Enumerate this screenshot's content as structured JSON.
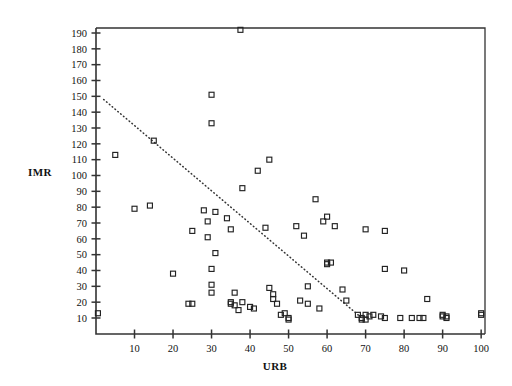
{
  "figure": {
    "background": "#ffffff",
    "axis_color": "#333333",
    "marker_color": "#222222",
    "trend_color": "#333333"
  },
  "chart_data": {
    "type": "scatter",
    "title": "",
    "xlabel": "URB",
    "ylabel": "IMR",
    "xlim": [
      0,
      101
    ],
    "ylim": [
      0,
      196
    ],
    "grid": false,
    "legend": "none",
    "xticks": [
      10,
      20,
      30,
      40,
      50,
      60,
      70,
      80,
      90,
      100
    ],
    "yticks": [
      10,
      20,
      30,
      40,
      50,
      60,
      70,
      80,
      90,
      100,
      110,
      120,
      130,
      140,
      150,
      160,
      170,
      180,
      190
    ],
    "marker": "open-square",
    "marker_size": 5,
    "points": [
      [
        0.5,
        13
      ],
      [
        5,
        113
      ],
      [
        10,
        79
      ],
      [
        14,
        81
      ],
      [
        15,
        122
      ],
      [
        20,
        38
      ],
      [
        24,
        19
      ],
      [
        25,
        19
      ],
      [
        25,
        65
      ],
      [
        28,
        78
      ],
      [
        29,
        71
      ],
      [
        29,
        61
      ],
      [
        30,
        151
      ],
      [
        30,
        133
      ],
      [
        30,
        31
      ],
      [
        30,
        26
      ],
      [
        30,
        41
      ],
      [
        31,
        77
      ],
      [
        31,
        51
      ],
      [
        34,
        73
      ],
      [
        35,
        20
      ],
      [
        35,
        19
      ],
      [
        35,
        66
      ],
      [
        36,
        18
      ],
      [
        36,
        26
      ],
      [
        37,
        15
      ],
      [
        37.5,
        192
      ],
      [
        38,
        20
      ],
      [
        38,
        92
      ],
      [
        40,
        17
      ],
      [
        41,
        16
      ],
      [
        42,
        103
      ],
      [
        44,
        67
      ],
      [
        45,
        29
      ],
      [
        45,
        110
      ],
      [
        46,
        25
      ],
      [
        46,
        22
      ],
      [
        47,
        19
      ],
      [
        48,
        12
      ],
      [
        49,
        13
      ],
      [
        50,
        9
      ],
      [
        50,
        10
      ],
      [
        52,
        68
      ],
      [
        53,
        21
      ],
      [
        54,
        62
      ],
      [
        55,
        30
      ],
      [
        55,
        19
      ],
      [
        57,
        85
      ],
      [
        58,
        16
      ],
      [
        59,
        71
      ],
      [
        60,
        45
      ],
      [
        60,
        44
      ],
      [
        60,
        74
      ],
      [
        61,
        45
      ],
      [
        62,
        68
      ],
      [
        64,
        28
      ],
      [
        65,
        21
      ],
      [
        68,
        12
      ],
      [
        69,
        10
      ],
      [
        69,
        9
      ],
      [
        70,
        12
      ],
      [
        70,
        9
      ],
      [
        70,
        66
      ],
      [
        71,
        11
      ],
      [
        72,
        12
      ],
      [
        74,
        11
      ],
      [
        75,
        10
      ],
      [
        75,
        65
      ],
      [
        75,
        41
      ],
      [
        79,
        10
      ],
      [
        80,
        40
      ],
      [
        82,
        10
      ],
      [
        84,
        10
      ],
      [
        85,
        10
      ],
      [
        86,
        22
      ],
      [
        90,
        12
      ],
      [
        90,
        11
      ],
      [
        91,
        11
      ],
      [
        91,
        10
      ],
      [
        100,
        13
      ],
      [
        100,
        12
      ]
    ],
    "trend": {
      "style": "dotted",
      "x_start": 2,
      "y_start": 148,
      "x_end": 69,
      "y_end": 10
    }
  }
}
